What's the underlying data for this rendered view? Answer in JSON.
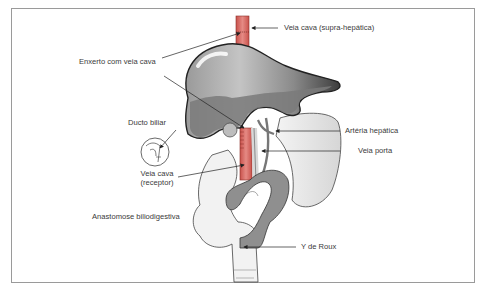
{
  "figure": {
    "labels": {
      "veia_cava_supra": "Veia cava (supra-hepática)",
      "enxerto": "Enxerto com veia cava",
      "ducto_biliar": "Ducto biliar",
      "arteria_hepatica": "Artéria hepática",
      "veia_porta": "Veia porta",
      "veia_cava_receptor_1": "Veia cava",
      "veia_cava_receptor_2": "(receptor)",
      "anastomose": "Anastomose biliodigestiva",
      "y_roux": "Y de Roux"
    },
    "colors": {
      "vena_cava": "#d9706a",
      "liver_light": "#b9b9b9",
      "liver_dark": "#5a5a5a",
      "intestine_gray": "#8f8f8f",
      "outline": "#333333",
      "frame": "#9a9a9a"
    }
  }
}
